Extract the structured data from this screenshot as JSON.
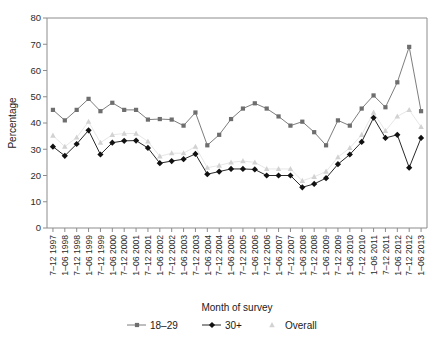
{
  "chart_data": {
    "type": "line",
    "title": "",
    "xlabel": "Month of survey",
    "ylabel": "Percentage",
    "ylim": [
      0,
      80
    ],
    "ytick_step": 10,
    "yticks": [
      0,
      10,
      20,
      30,
      40,
      50,
      60,
      70,
      80
    ],
    "grid": false,
    "legend_position": "bottom",
    "categories": [
      "7–12 1997",
      "1–06 1998",
      "7–12 1998",
      "1–06 1999",
      "7–12 1999",
      "1–06 2000",
      "7–12 2000",
      "1–06 2001",
      "7–12 2001",
      "1–06 2002",
      "7–12 2002",
      "1–06 2003",
      "7–12 2003",
      "1–06 2004",
      "7–12 2004",
      "1–06 2005",
      "7–12 2005",
      "1–06 2006",
      "7–12 2006",
      "1–06 2007",
      "7–12 2007",
      "1–06 2008",
      "7–12 2008",
      "1–06 2009",
      "7–12 2009",
      "1–06 2010",
      "7–12 2010",
      "1–06 2011",
      "7–12 2011",
      "1–06 2012",
      "7–12 2012",
      "1–06 2013"
    ],
    "series": [
      {
        "name": "18–29",
        "color": "#6e6e6e",
        "marker": "square",
        "values": [
          45,
          41,
          45,
          49.2,
          44.5,
          47.7,
          45,
          45,
          41.3,
          41.5,
          41.3,
          39,
          44,
          31.5,
          35.5,
          41.5,
          45.5,
          47.5,
          45.5,
          42.5,
          39,
          40.5,
          36.5,
          31.5,
          41,
          39,
          45.5,
          50.5,
          46,
          55.5,
          69,
          44.5
        ]
      },
      {
        "name": "30+",
        "color": "#111111",
        "marker": "diamond",
        "values": [
          31,
          27.5,
          32,
          37.2,
          28,
          32.5,
          33.2,
          33.3,
          30.5,
          24.7,
          25.5,
          26.2,
          28.2,
          20.5,
          21.5,
          22.5,
          22.5,
          22.3,
          20,
          20,
          20,
          15.5,
          16.8,
          19,
          24.3,
          28,
          32.8,
          42,
          34.3,
          35.5,
          23,
          34.3
        ]
      },
      {
        "name": "Overall",
        "color": "#d2d2d2",
        "marker": "triangle",
        "values": [
          35.2,
          31,
          34.5,
          40.5,
          32.5,
          35.5,
          36,
          36,
          33,
          27.3,
          28.5,
          28.5,
          31,
          23,
          23.8,
          25,
          25.5,
          25,
          22.5,
          22.5,
          22.5,
          18,
          19.5,
          21.5,
          27,
          30.5,
          35.5,
          44,
          37,
          42.5,
          45,
          38.5
        ]
      }
    ]
  },
  "axis": {
    "y_title": "Percentage",
    "x_title": "Month of survey"
  },
  "legend": {
    "items": [
      {
        "label": "18–29",
        "marker": "square",
        "color": "#6e6e6e"
      },
      {
        "label": "30+",
        "marker": "diamond",
        "color": "#111111"
      },
      {
        "label": "Overall",
        "marker": "triangle",
        "color": "#d2d2d2"
      }
    ]
  }
}
